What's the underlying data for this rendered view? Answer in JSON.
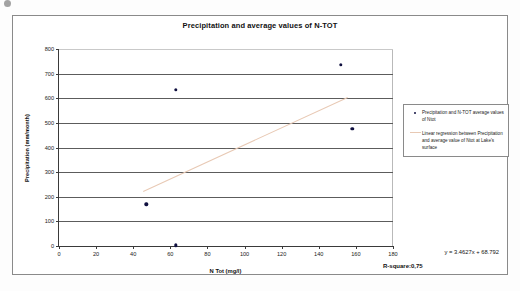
{
  "chart_data": {
    "type": "scatter",
    "title": "Precipitation and average values of N-TOT",
    "xlabel": "N Tot (mg/l)",
    "ylabel": "Precipitation (mm/month)",
    "xlim": [
      0,
      180
    ],
    "ylim": [
      0,
      800
    ],
    "xticks": [
      0,
      20,
      40,
      60,
      80,
      100,
      120,
      140,
      160,
      180
    ],
    "yticks": [
      0,
      100,
      200,
      300,
      400,
      500,
      600,
      700,
      800
    ],
    "grid": "horizontal",
    "legend_position": "right",
    "series": [
      {
        "name": "Precipitation and N-TOT average values of Ntot",
        "marker": "dot",
        "color": "#101040",
        "points": [
          {
            "x": 47,
            "y": 170
          },
          {
            "x": 63,
            "y": 3
          },
          {
            "x": 63,
            "y": 635
          },
          {
            "x": 152,
            "y": 735
          },
          {
            "x": 158,
            "y": 475
          }
        ]
      },
      {
        "name": "Linear regression between Precipitation and average value of Ntot at Lake's surface",
        "marker": "line",
        "color": "#e8c9b4",
        "slope": 3.4627,
        "intercept": 68.792,
        "x_start": 45,
        "x_end": 155
      }
    ],
    "annotations": {
      "equation": "y = 3.4627x + 68.792",
      "r_square": "R-square:0,75"
    }
  },
  "legend": {
    "entries": [
      {
        "label": "Precipitation and N-TOT average values of Ntot",
        "key": "dot"
      },
      {
        "label": "Linear regression between Precipitation and average value of Ntot at Lake's surface",
        "key": "line"
      }
    ]
  }
}
